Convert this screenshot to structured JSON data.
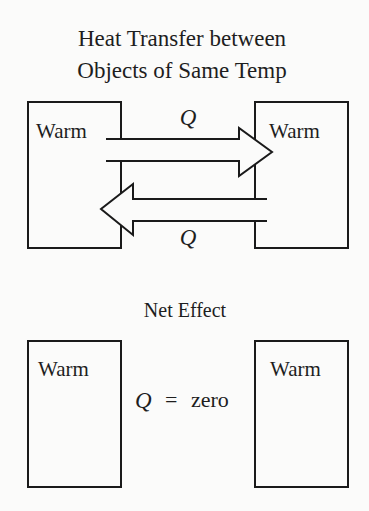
{
  "diagram": {
    "title_line1": "Heat Transfer between",
    "title_line2": "Objects of Same Temp",
    "top_section": {
      "left_object": {
        "label": "Warm"
      },
      "right_object": {
        "label": "Warm"
      },
      "arrow_right": {
        "label": "Q",
        "direction": "left-to-right"
      },
      "arrow_left": {
        "label": "Q",
        "direction": "right-to-left"
      }
    },
    "bottom_section": {
      "title": "Net Effect",
      "left_object": {
        "label": "Warm"
      },
      "right_object": {
        "label": "Warm"
      },
      "equation": {
        "symbol": "Q",
        "operator": "=",
        "value": "zero"
      }
    }
  }
}
